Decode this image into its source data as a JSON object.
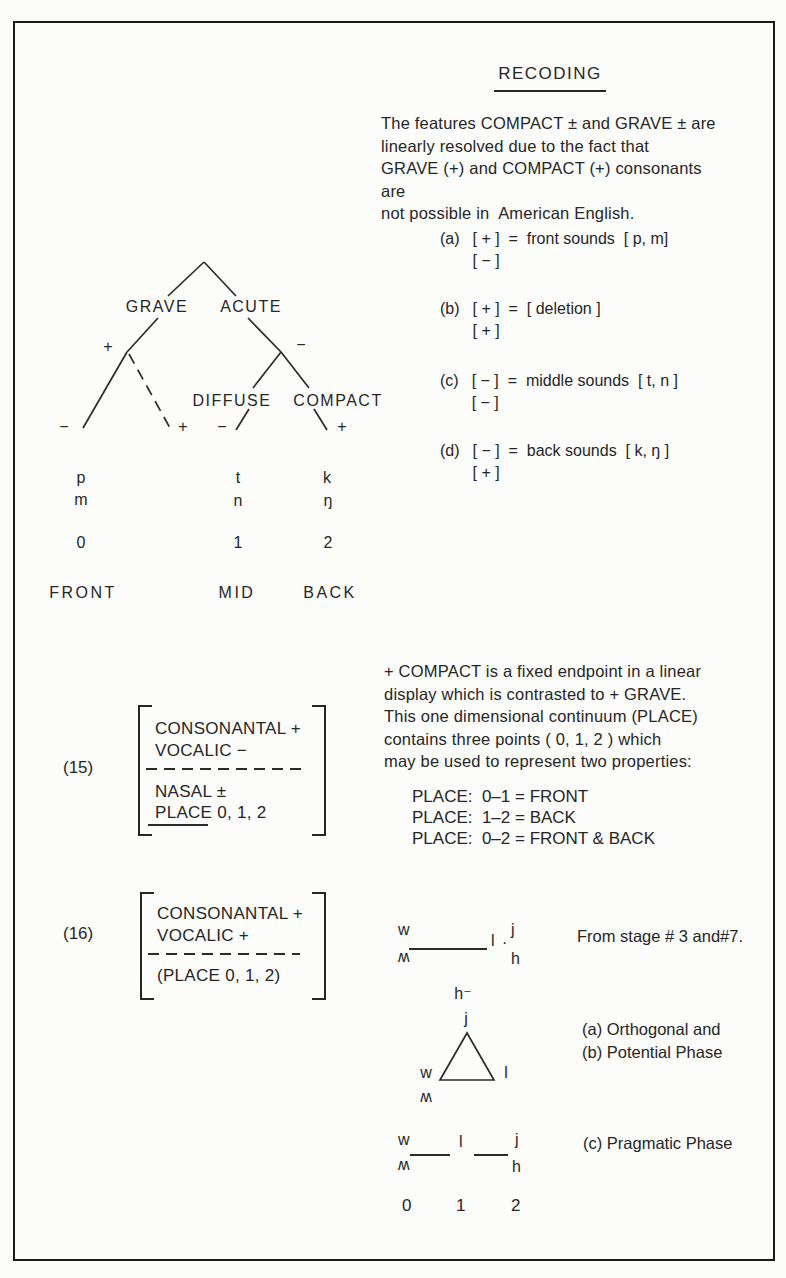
{
  "title": "RECODING",
  "intro": {
    "lines": [
      "The features COMPACT ± and GRAVE ± are",
      "linearly resolved due to the fact that",
      "GRAVE (+) and COMPACT (+) consonants are",
      "not possible in  American English."
    ]
  },
  "rules": [
    {
      "label": "(a)",
      "line1": "[ + ]  =  front sounds  [ p, m]",
      "line2": "[ − ]"
    },
    {
      "label": "(b)",
      "line1": "[ + ]  =  [ deletion ]",
      "line2": "[ + ]"
    },
    {
      "label": "(c)",
      "line1": "[ − ]  =  middle sounds  [ t, n ]",
      "line2": "[ − ]"
    },
    {
      "label": "(d)",
      "line1": "[ − ]  =  back sounds  [ k, ŋ ]",
      "line2": "[ + ]"
    }
  ],
  "tree": {
    "labels": {
      "grave": "GRAVE",
      "acute": "ACUTE",
      "diffuse": "DIFFUSE",
      "compact": "COMPACT"
    },
    "signs": {
      "grave_node": "+",
      "grave_left": "−",
      "grave_dashed": "+",
      "acute_node": "−",
      "diffuse_leaf": "−",
      "compact_leaf": "+"
    },
    "phonemes": {
      "front": [
        "p",
        "m"
      ],
      "mid": [
        "t",
        "n"
      ],
      "back": [
        "k",
        "ŋ"
      ]
    },
    "scale": [
      "0",
      "1",
      "2"
    ],
    "positions": [
      "FRONT",
      "MID",
      "BACK"
    ]
  },
  "matrix15": {
    "label": "(15)",
    "row1": "CONSONANTAL +",
    "row2": "VOCALIC −",
    "row3": "NASAL ±",
    "row4": "PLACE 0, 1, 2"
  },
  "matrix16": {
    "label": "(16)",
    "row1": "CONSONANTAL +",
    "row2": "VOCALIC +",
    "row3": "(PLACE 0, 1, 2)"
  },
  "compact_para": {
    "lines": [
      "+ COMPACT is a fixed endpoint in a linear",
      "display which is contrasted to + GRAVE.",
      "This one dimensional continuum (PLACE)",
      "contains three points ( 0, 1, 2 ) which",
      "may be used to represent two properties:"
    ]
  },
  "place_rules": [
    "PLACE:  0–1 = FRONT",
    "PLACE:  1–2 = BACK",
    "PLACE:  0–2 = FRONT & BACK"
  ],
  "stage_diagram": {
    "w": "w",
    "wh": "ʍ",
    "l": "l",
    "dot": "·",
    "j": "j",
    "h": "h",
    "note": "From stage # 3 and#7."
  },
  "triangle_diagram": {
    "h": "h⁻",
    "j": "j",
    "w": "w",
    "wh": "ʍ",
    "l": "l"
  },
  "phase_labels": {
    "a": "(a) Orthogonal and",
    "b": "(b) Potential Phase",
    "c": "(c) Pragmatic Phase"
  },
  "pragmatic_diagram": {
    "w": "w",
    "wh": "ʍ",
    "l": "l",
    "j": "j",
    "h": "h"
  },
  "bottom_scale": [
    "0",
    "1",
    "2"
  ]
}
